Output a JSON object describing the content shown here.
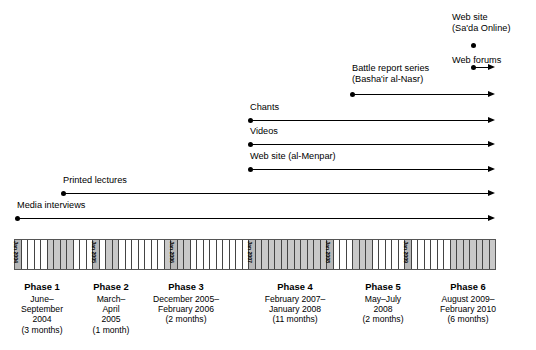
{
  "figure": {
    "type": "timeline"
  },
  "media_tracks": [
    {
      "label": "Web site (Sa'da Online)",
      "label_lines": [
        "Web site",
        "(Sa'da Online)"
      ],
      "kind": "point",
      "start_x": 473,
      "end_x": 473,
      "dot_y": 45,
      "label_x": 452,
      "label_y": 12
    },
    {
      "label": "Web forums",
      "label_lines": [
        "Web forums"
      ],
      "kind": "arrow",
      "start_x": 473,
      "end_x": 493,
      "dot_y": 67,
      "label_x": 452,
      "label_y": 55
    },
    {
      "label": "Battle report series (Basha'ir al-Nasr)",
      "label_lines": [
        "Battle report series",
        "(Basha'ir al-Nasr)"
      ],
      "kind": "arrow",
      "start_x": 352,
      "end_x": 493,
      "dot_y": 94,
      "label_x": 352,
      "label_y": 63
    },
    {
      "label": "Chants",
      "label_lines": [
        "Chants"
      ],
      "kind": "arrow",
      "start_x": 250,
      "end_x": 493,
      "dot_y": 120,
      "label_x": 250,
      "label_y": 102
    },
    {
      "label": "Videos",
      "label_lines": [
        "Videos"
      ],
      "kind": "arrow",
      "start_x": 250,
      "end_x": 493,
      "dot_y": 144,
      "label_x": 250,
      "label_y": 126
    },
    {
      "label": "Web site (al-Menpar)",
      "label_lines": [
        "Web site (al-Menpar)"
      ],
      "kind": "arrow",
      "start_x": 250,
      "end_x": 493,
      "dot_y": 169,
      "label_x": 250,
      "label_y": 151
    },
    {
      "label": "Printed lectures",
      "label_lines": [
        "Printed lectures"
      ],
      "kind": "arrow",
      "start_x": 63,
      "end_x": 493,
      "dot_y": 193,
      "label_x": 63,
      "label_y": 175
    },
    {
      "label": "Media interviews",
      "label_lines": [
        "Media interviews"
      ],
      "kind": "arrow",
      "start_x": 17,
      "end_x": 493,
      "dot_y": 218,
      "label_x": 17,
      "label_y": 200
    }
  ],
  "month_axis": {
    "start": "Jan 2004",
    "end": "Feb 2010",
    "total_months": 74,
    "year_marks": [
      "Jan 2004",
      "Jan 2005",
      "Jan 2006",
      "Jan 2007",
      "Jan 2008",
      "Jan 2009"
    ],
    "year_mark_indices": [
      0,
      12,
      24,
      36,
      48,
      60
    ],
    "shaded_month_indices": [
      5,
      6,
      7,
      8,
      14,
      15,
      23,
      24,
      25,
      26,
      37,
      38,
      39,
      40,
      41,
      42,
      43,
      44,
      45,
      46,
      47,
      48,
      52,
      53,
      54,
      67,
      68,
      69,
      70,
      71,
      72,
      73
    ]
  },
  "phases": [
    {
      "name": "Phase 1",
      "date_lines": [
        "June–",
        "September",
        "2004"
      ],
      "duration": "(3 months)",
      "center_x": 42,
      "top": 281
    },
    {
      "name": "Phase 2",
      "date_lines": [
        "March–",
        "April",
        "2005"
      ],
      "duration": "(1 month)",
      "center_x": 111,
      "top": 281
    },
    {
      "name": "Phase 3",
      "date_lines": [
        "December 2005–",
        "February 2006"
      ],
      "duration": "(2 months)",
      "center_x": 186,
      "top": 281
    },
    {
      "name": "Phase 4",
      "date_lines": [
        "February 2007–",
        "January 2008"
      ],
      "duration": "(11 months)",
      "center_x": 295,
      "top": 281
    },
    {
      "name": "Phase 5",
      "date_lines": [
        "May–July",
        "2008"
      ],
      "duration": "(2 months)",
      "center_x": 383,
      "top": 281
    },
    {
      "name": "Phase 6",
      "date_lines": [
        "August 2009–",
        "February 2010"
      ],
      "duration": "(6 months)",
      "center_x": 468,
      "top": 281
    }
  ],
  "colors": {
    "ink": "#000000",
    "shade": "#c9c9c9",
    "jan_shade": "#b8b8b8",
    "grid": "#444444"
  }
}
